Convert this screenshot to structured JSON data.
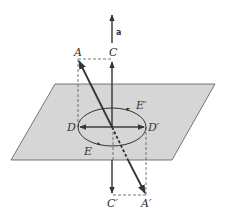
{
  "diagram": {
    "type": "geometry-reflection",
    "colors": {
      "plane_fill": "#d6d6d6",
      "plane_stroke": "#555555",
      "stroke": "#333333",
      "background": "#ffffff"
    },
    "labels": {
      "normal": "a",
      "A": "A",
      "C": "C",
      "D": "D",
      "D_prime": "D′",
      "E": "E",
      "E_prime": "E′",
      "C_prime": "C′",
      "A_prime": "A′"
    }
  }
}
